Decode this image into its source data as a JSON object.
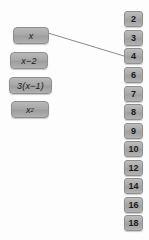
{
  "canvas": {
    "width": 149,
    "height": 240,
    "background": "#fdfdfd"
  },
  "style": {
    "tile_fill": "#aaaaaa",
    "tile_border": "#909090",
    "tile_text": "#1a1a1a",
    "connector_color": "#8a8a8a"
  },
  "expressions": {
    "items": [
      {
        "label": "x",
        "base": "x",
        "exponent": "",
        "x": 13,
        "y": 27,
        "w": 36
      },
      {
        "label": "x−2",
        "base": "x−2",
        "exponent": "",
        "x": 10,
        "y": 52,
        "w": 38
      },
      {
        "label": "3(x−1)",
        "base": "3(x−1)",
        "exponent": "",
        "x": 9,
        "y": 77,
        "w": 43
      },
      {
        "label": "x²",
        "base": "x",
        "exponent": "2",
        "x": 11,
        "y": 101,
        "w": 38
      }
    ]
  },
  "numbers": {
    "items": [
      {
        "label": "2",
        "y": 11
      },
      {
        "label": "3",
        "y": 30
      },
      {
        "label": "4",
        "y": 48
      },
      {
        "label": "6",
        "y": 67
      },
      {
        "label": "7",
        "y": 86
      },
      {
        "label": "8",
        "y": 104
      },
      {
        "label": "9",
        "y": 123
      },
      {
        "label": "10",
        "y": 141
      },
      {
        "label": "12",
        "y": 160
      },
      {
        "label": "14",
        "y": 178
      },
      {
        "label": "16",
        "y": 197
      },
      {
        "label": "18",
        "y": 215
      }
    ]
  },
  "connectors": {
    "items": [
      {
        "from_label": "x",
        "to_label": "4",
        "x1": 48,
        "y1": 33,
        "x2": 124,
        "y2": 56
      }
    ]
  }
}
